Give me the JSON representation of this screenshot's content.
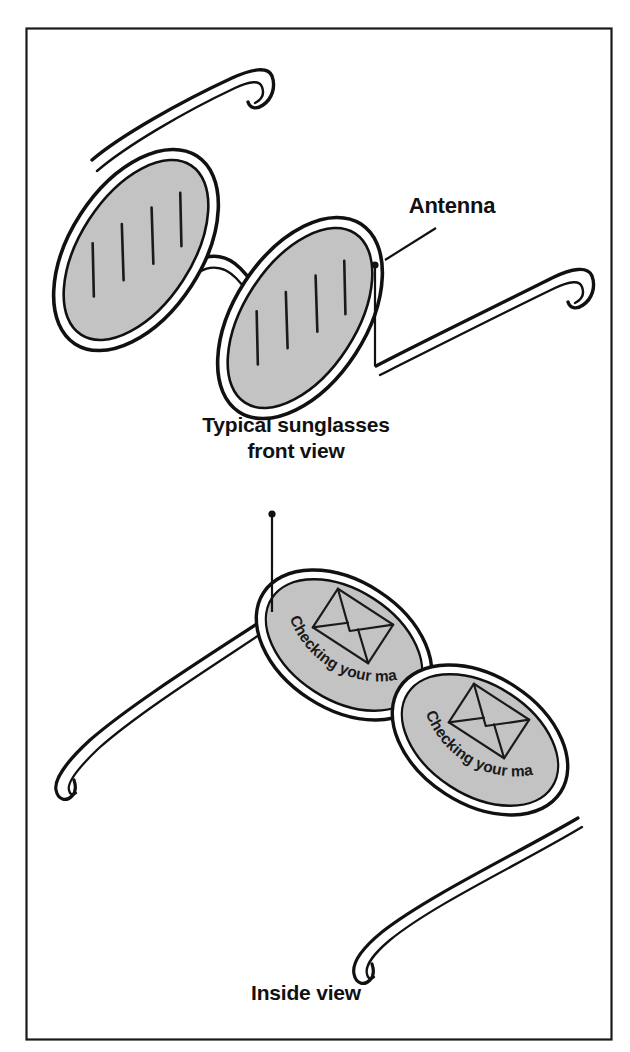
{
  "figure": {
    "background_color": "#ffffff",
    "border_color": "#1a1a1a",
    "ink_color": "#111111",
    "lens_fill_color": "#c3c3c3",
    "lens_highlight_color": "#1a1a1a"
  },
  "callouts": [
    {
      "id": "antenna",
      "label": "Antenna"
    }
  ],
  "views": [
    {
      "id": "front-view",
      "caption_line_1": "Typical sunglasses",
      "caption_line_2": "front view",
      "lens_count": 2,
      "has_antenna": true
    },
    {
      "id": "inside-view",
      "caption_line_1": "Inside view",
      "caption_line_2": "",
      "lens_count": 2,
      "has_antenna": true
    }
  ],
  "lens_labels": {
    "left_lens": "Checking your mail",
    "right_lens": "Checking your mail"
  },
  "icons": {
    "envelope": "envelope-icon"
  }
}
